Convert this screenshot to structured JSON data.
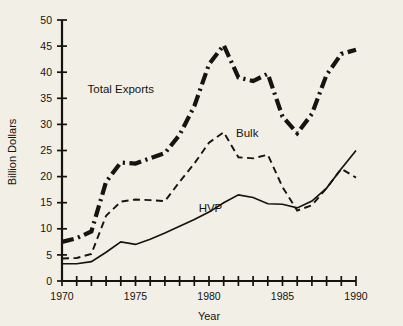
{
  "chart_data": {
    "type": "line",
    "title": "",
    "xlabel": "Year",
    "ylabel": "Billion Dollars",
    "xlim": [
      1970,
      1990
    ],
    "ylim": [
      0,
      50
    ],
    "ytick_step": 5,
    "xtick_step": 1,
    "xtick_label_step": 5,
    "grid": false,
    "legend_position": "inline-annotations",
    "x": [
      1970,
      1971,
      1972,
      1973,
      1974,
      1975,
      1976,
      1977,
      1978,
      1979,
      1980,
      1981,
      1982,
      1983,
      1984,
      1985,
      1986,
      1987,
      1988,
      1989,
      1990
    ],
    "xticklabels": [
      "1970",
      "",
      "",
      "",
      "",
      "1975",
      "",
      "",
      "",
      "",
      "1980",
      "",
      "",
      "",
      "",
      "1985",
      "",
      "",
      "",
      "",
      "1990"
    ],
    "yticklabels": [
      "0",
      "5",
      "10",
      "15",
      "20",
      "25",
      "30",
      "35",
      "40",
      "45",
      "50"
    ],
    "yticks": [
      0,
      5,
      10,
      15,
      20,
      25,
      30,
      35,
      40,
      45,
      50
    ],
    "series": [
      {
        "name": "Total Exports",
        "style": "dash-dot-thick",
        "color": "#161310",
        "label_x": 1974.0,
        "label_y": 36.0,
        "values": [
          7.5,
          8.2,
          9.5,
          19.0,
          22.7,
          22.5,
          23.5,
          24.5,
          28.0,
          33.5,
          41.5,
          45.2,
          39.0,
          38.3,
          39.7,
          31.5,
          28.3,
          32.0,
          39.5,
          43.5,
          44.3
        ]
      },
      {
        "name": "Bulk",
        "style": "dashed",
        "color": "#161310",
        "label_x": 1982.6,
        "label_y": 27.5,
        "values": [
          4.3,
          4.4,
          5.2,
          12.5,
          15.2,
          15.6,
          15.5,
          15.3,
          19.0,
          22.5,
          26.5,
          28.5,
          23.7,
          23.5,
          24.2,
          18.0,
          13.5,
          14.5,
          17.8,
          21.5,
          19.8
        ]
      },
      {
        "name": "HVP",
        "style": "solid",
        "color": "#161310",
        "label_x": 1980.1,
        "label_y": 13.2,
        "values": [
          3.3,
          3.3,
          3.7,
          5.5,
          7.5,
          7.0,
          8.0,
          9.2,
          10.5,
          11.8,
          13.2,
          15.0,
          16.5,
          16.0,
          14.8,
          14.7,
          14.0,
          15.3,
          17.8,
          21.5,
          25.0
        ]
      }
    ]
  },
  "figure": {
    "background_color": "#f2efe6",
    "axis_color": "#161310",
    "ylabel_text": "Billion Dollars",
    "xlabel_text": "Year"
  }
}
